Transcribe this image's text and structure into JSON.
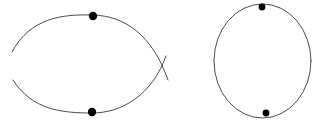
{
  "canvas": {
    "width": 331,
    "height": 124,
    "background_color": "#ffffff",
    "stroke_color": "#4a4a4a",
    "dot_color": "#000000",
    "stroke_width": 1
  },
  "figures": [
    {
      "id": "lens-figure",
      "name": "lens-two-arcs-crossing",
      "description": "Two circular arcs bulging apart, crossing near the left and right ends so their tails form small X marks; two filled vertex dots at the top and bottom of the lens.",
      "arcs": [
        {
          "name": "upper-arc",
          "path": "M 12,52 C 30,18 62,14 93,15 C 124,16 152,34 168,80"
        },
        {
          "name": "lower-arc",
          "path": "M 13,80 C 32,110 62,113 92,113 C 122,113 152,95 166,56"
        }
      ],
      "crossings": [
        {
          "name": "left-crossing",
          "x": 21,
          "y": 64
        },
        {
          "name": "right-crossing",
          "x": 163,
          "y": 70
        }
      ],
      "dots": [
        {
          "name": "top-vertex-dot",
          "cx": 93,
          "cy": 16,
          "r": 4.2
        },
        {
          "name": "bottom-vertex-dot",
          "cx": 92,
          "cy": 112,
          "r": 4.2
        }
      ]
    },
    {
      "id": "circle-figure",
      "name": "circle-with-two-points",
      "description": "A single closed circle (very slightly elliptical) with two small filled dots marking points near the top and the bottom of the circumference.",
      "ellipse": {
        "cx": 262.5,
        "cy": 61,
        "rx": 48.5,
        "ry": 57
      },
      "dots": [
        {
          "name": "top-point-dot",
          "cx": 262,
          "cy": 7,
          "r": 3.4
        },
        {
          "name": "bottom-point-dot",
          "cx": 266,
          "cy": 113,
          "r": 3.4
        }
      ]
    }
  ]
}
